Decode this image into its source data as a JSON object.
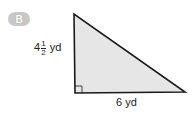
{
  "badge": {
    "label": "B"
  },
  "figure": {
    "shape": "right-triangle",
    "fill": "#e6e6e6",
    "stroke": "#1a1a1a",
    "height_label": {
      "whole": "4",
      "numerator": "1",
      "denominator": "2",
      "unit": "yd"
    },
    "base_label": "6 yd"
  }
}
